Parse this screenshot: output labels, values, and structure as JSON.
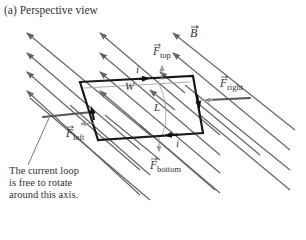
{
  "figure": {
    "title": "(a) Perspective view",
    "caption_lines": [
      "The current loop",
      "is free to rotate",
      "around this axis."
    ],
    "labels": {
      "B": "B",
      "F": "F",
      "top": "top",
      "right": "right",
      "left": "left",
      "bottom": "bottom",
      "W": "W",
      "L": "L",
      "i": "i"
    },
    "colors": {
      "field_line": "#666666",
      "loop": "#1a1a1a",
      "axis": "#555555",
      "force_arrow": "#8a8a8a",
      "text": "#333333"
    }
  }
}
